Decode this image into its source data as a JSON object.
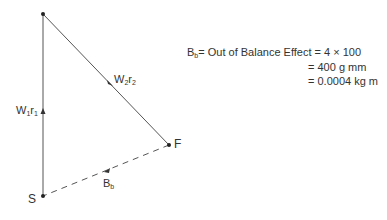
{
  "diagram": {
    "points": {
      "top": {
        "x": 43,
        "y": 14
      },
      "S": {
        "x": 43,
        "y": 196,
        "label": "S"
      },
      "F": {
        "x": 169,
        "y": 145,
        "label": "F"
      }
    },
    "vectors": [
      {
        "name": "W1r1",
        "base": "W",
        "sub1": "1",
        "mid": "r",
        "sub2": "1",
        "style": "solid"
      },
      {
        "name": "W2r2",
        "base": "W",
        "sub1": "2",
        "mid": "r",
        "sub2": "2",
        "style": "solid"
      },
      {
        "name": "Bb",
        "base": "B",
        "sub1": "b",
        "style": "dashed"
      }
    ],
    "equation": {
      "lhs_base": "B",
      "lhs_sub": "b",
      "line1": "= Out of Balance Effect = 4 × 100",
      "line2": "= 400 g mm",
      "line3": "= 0.0004 kg m"
    },
    "colors": {
      "line": "#555555",
      "text": "#333333"
    }
  }
}
